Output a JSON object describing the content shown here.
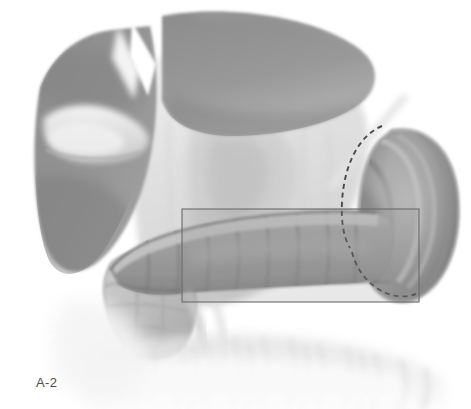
{
  "figure": {
    "label": "A-2",
    "width": 471,
    "height": 409,
    "background_color": "#ffffff"
  },
  "palette": {
    "background": "#ffffff",
    "dark_organ": "#8e8e8e",
    "dark_organ_shadow": "#7c7c7c",
    "mid_organ": "#9a9a9a",
    "light_organ": "#cfcfcf",
    "pale_tissue": "#e6e6e6",
    "faint_tissue": "#f2f2f2",
    "outline": "#5a5a5a",
    "dashed_line": "#4a4a4a",
    "overlay_fill": "rgba(150,150,150,0.22)",
    "overlay_border": "#6b6b6b",
    "label_text": "#4c4c4c"
  },
  "structures": [
    {
      "id": "liver-left-lobe",
      "name": "Liver left lobe",
      "tone": "#8e8e8e",
      "region": "upper-left"
    },
    {
      "id": "liver-right-lobe",
      "name": "Liver right lobe",
      "tone": "#909090",
      "region": "upper-center"
    },
    {
      "id": "gallbladder-tongue",
      "name": "Pale lobe / gallbladder",
      "tone": "#dcdcdc",
      "region": "left"
    },
    {
      "id": "stomach-omentum",
      "name": "Stomach and greater omentum",
      "tone": "#e2e2e2",
      "region": "center"
    },
    {
      "id": "transverse-colon",
      "name": "Transverse colon with haustra",
      "tone": "#9f9f9f",
      "region": "center-band"
    },
    {
      "id": "splenic-flexure",
      "name": "Colonic flexure segment",
      "tone": "#b5b5b5",
      "region": "lower-left"
    },
    {
      "id": "duodenum",
      "name": "Duodenum with mucosal folds",
      "tone": "#949494",
      "region": "right"
    },
    {
      "id": "mesenteric-fringe",
      "name": "Omental / mesenteric fringe",
      "tone": "#f0f0f0",
      "region": "bottom"
    }
  ],
  "annotations": [
    {
      "id": "highlight-rectangle",
      "name": "Translucent highlight rectangle over colon",
      "type": "rectangle",
      "x": 182,
      "y": 209,
      "width": 237,
      "height": 93,
      "fill": "rgba(150,150,150,0.22)",
      "stroke": "#6b6b6b"
    },
    {
      "id": "dashed-outline",
      "name": "Dashed resection outline around duodenum",
      "type": "dashed-curve",
      "stroke": "#4a4a4a",
      "dash": "5 4"
    }
  ]
}
